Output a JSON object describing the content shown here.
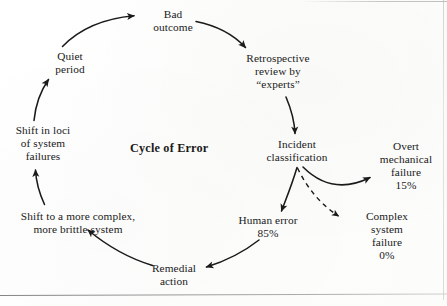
{
  "diagram": {
    "title": "Cycle of Error",
    "nodes": {
      "bad_outcome": {
        "lines": [
          "Bad",
          "outcome"
        ]
      },
      "retrospective": {
        "lines": [
          "Retrospective",
          "review by",
          "“experts”"
        ]
      },
      "incident": {
        "lines": [
          "Incident",
          "classification"
        ]
      },
      "overt_mechanical": {
        "lines": [
          "Overt",
          "mechanical",
          "failure",
          "15%"
        ]
      },
      "complex_system": {
        "lines": [
          "Complex",
          "system",
          "failure",
          "0%"
        ]
      },
      "human_error": {
        "lines": [
          "Human error",
          "85%"
        ]
      },
      "remedial_action": {
        "lines": [
          "Remedial",
          "action"
        ]
      },
      "shift_complex": {
        "lines": [
          "Shift to a more complex,",
          "more brittle system"
        ]
      },
      "shift_loci": {
        "lines": [
          "Shift in loci",
          "of system",
          "failures"
        ]
      },
      "quiet_period": {
        "lines": [
          "Quiet",
          "period"
        ]
      }
    },
    "edges": [
      {
        "name": "quiet-to-bad-outcome",
        "style": "solid"
      },
      {
        "name": "bad-outcome-to-retrospective",
        "style": "solid"
      },
      {
        "name": "retrospective-to-incident",
        "style": "solid"
      },
      {
        "name": "incident-to-overt-mechanical",
        "style": "solid"
      },
      {
        "name": "incident-to-complex-system",
        "style": "dashed"
      },
      {
        "name": "incident-to-human-error",
        "style": "solid"
      },
      {
        "name": "human-error-to-remedial",
        "style": "solid"
      },
      {
        "name": "remedial-to-shift-complex",
        "style": "solid"
      },
      {
        "name": "shift-complex-to-shift-loci",
        "style": "solid"
      },
      {
        "name": "shift-loci-to-quiet",
        "style": "solid"
      }
    ],
    "colors": {
      "ink": "#1a1a1a",
      "paper": "#fdfdfd",
      "rule": "#8c8c8c"
    }
  }
}
